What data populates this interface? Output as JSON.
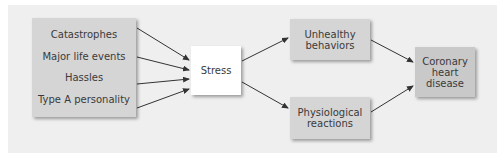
{
  "diagram": {
    "stressors": [
      "Catastrophes",
      "Major life events",
      "Hassles",
      "Type A personality"
    ],
    "central": "Stress",
    "pathways": [
      "Unhealthy behaviors",
      "Physiological reactions"
    ],
    "outcome": "Coronary heart disease",
    "outcome_lines": [
      "Coronary",
      "heart",
      "disease"
    ],
    "unhealthy_lines": [
      "Unhealthy",
      "behaviors"
    ],
    "physiological_lines": [
      "Physiological",
      "reactions"
    ]
  },
  "colors": {
    "panel": "#efefef",
    "box": "#d5d5d5",
    "outcome_box": "#c9c9c9",
    "stress_box": "#ffffff",
    "arrow": "#333333"
  }
}
